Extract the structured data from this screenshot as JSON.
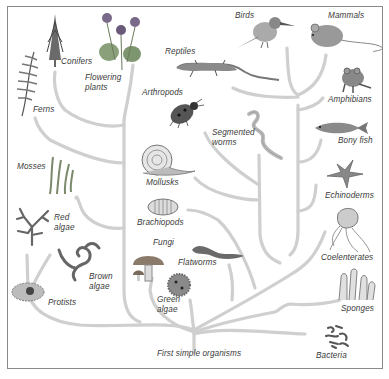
{
  "diagram": {
    "type": "tree-of-life",
    "root_label": "First simple organisms",
    "branch_color": "#cfcfcf",
    "text_color": "#3a3a3a",
    "border_color": "#8a8a8a"
  },
  "labels": {
    "conifers": "Conifers",
    "flowering_plants": "Flowering\nplants",
    "ferns": "Ferns",
    "mosses": "Mosses",
    "red_algae": "Red\nalgae",
    "brown_algae": "Brown\nalgae",
    "protists": "Protists",
    "green_algae": "Green\nalgae",
    "fungi": "Fungi",
    "flatworms": "Flatworms",
    "brachiopods": "Brachiopods",
    "mollusks": "Mollusks",
    "arthropods": "Arthropods",
    "segmented_worms": "Segmented\nworms",
    "reptiles": "Reptiles",
    "birds": "Birds",
    "mammals": "Mammals",
    "amphibians": "Amphibians",
    "bony_fish": "Bony fish",
    "echinoderms": "Echinoderms",
    "coelenterates": "Coelenterates",
    "sponges": "Sponges",
    "bacteria": "Bacteria",
    "root": "First simple organisms"
  },
  "organisms": [
    {
      "key": "conifers",
      "icon": "conifer-tree-icon"
    },
    {
      "key": "flowering_plants",
      "icon": "violet-flower-icon"
    },
    {
      "key": "ferns",
      "icon": "fern-frond-icon"
    },
    {
      "key": "mosses",
      "icon": "moss-icon"
    },
    {
      "key": "red_algae",
      "icon": "red-algae-icon"
    },
    {
      "key": "brown_algae",
      "icon": "brown-algae-icon"
    },
    {
      "key": "protists",
      "icon": "protist-icon"
    },
    {
      "key": "green_algae",
      "icon": "green-algae-sphere-icon"
    },
    {
      "key": "fungi",
      "icon": "mushroom-icon"
    },
    {
      "key": "flatworms",
      "icon": "flatworm-icon"
    },
    {
      "key": "brachiopods",
      "icon": "brachiopod-shell-icon"
    },
    {
      "key": "mollusks",
      "icon": "snail-icon"
    },
    {
      "key": "arthropods",
      "icon": "ladybug-icon"
    },
    {
      "key": "segmented_worms",
      "icon": "earthworm-icon"
    },
    {
      "key": "reptiles",
      "icon": "lizard-icon"
    },
    {
      "key": "birds",
      "icon": "kingfisher-bird-icon"
    },
    {
      "key": "mammals",
      "icon": "mouse-icon"
    },
    {
      "key": "amphibians",
      "icon": "frog-icon"
    },
    {
      "key": "bony_fish",
      "icon": "fish-icon"
    },
    {
      "key": "echinoderms",
      "icon": "starfish-icon"
    },
    {
      "key": "coelenterates",
      "icon": "jellyfish-icon"
    },
    {
      "key": "sponges",
      "icon": "sponge-icon"
    },
    {
      "key": "bacteria",
      "icon": "bacteria-icon"
    }
  ]
}
